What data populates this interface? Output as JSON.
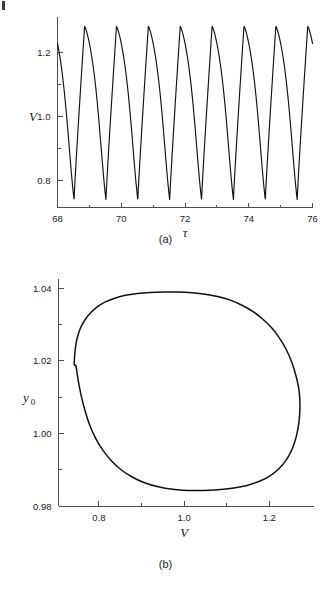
{
  "figure": {
    "background_color": "#ffffff",
    "line_color": "#111111",
    "axis_color": "#4d4d4d",
    "page_mark": "page-edge-mark"
  },
  "panels": [
    {
      "caption": "(a)",
      "name": "time-series-panel"
    },
    {
      "caption": "(b)",
      "name": "phase-portrait-panel"
    }
  ],
  "chart_data": [
    {
      "type": "line",
      "name": "voltage-time-series",
      "title": "",
      "subtitle": "",
      "xlabel": "τ",
      "ylabel": "V",
      "xlim": [
        68,
        76
      ],
      "ylim": [
        0.715,
        1.3
      ],
      "grid": false,
      "legend": null,
      "xticks": [
        68,
        70,
        72,
        74,
        76
      ],
      "xticklabels": [
        "68",
        "70",
        "72",
        "74",
        "76"
      ],
      "xminorticks": [
        69,
        71,
        73,
        75
      ],
      "yticks": [
        0.8,
        1.0,
        1.2
      ],
      "yticklabels": [
        "0.8",
        "1.0",
        "1.2"
      ],
      "yminorticks": [
        0.9,
        1.1
      ],
      "caption": "(a)",
      "description": "Relaxation-type periodic oscillation of V versus dimensionless time tau. Eight full cycles between tau = 68 and tau = 76, period approximately 1.0. Sharp narrow maxima near V = 1.28, rounded broad minima near V = 0.74. Each cycle rises quickly to the peak then falls more slowly. The trace starts at tau = 68 with V = 1.20 on a descending segment and is truncated at tau = 76 mid-descent near V = 1.21.",
      "period": 1.0,
      "peak_value": 1.283,
      "trough_value": 0.74,
      "mean_value": 1.0,
      "n_cycles": 8,
      "peak_times": [
        68.85,
        69.86,
        70.86,
        71.86,
        72.87,
        73.87,
        74.87,
        75.88
      ],
      "trough_times": [
        68.52,
        69.52,
        70.52,
        71.52,
        72.53,
        73.53,
        74.53,
        75.53
      ],
      "start_point": {
        "x": 68.0,
        "y": 1.205
      },
      "end_point": {
        "x": 76.0,
        "y": 1.212
      }
    },
    {
      "type": "line",
      "name": "limit-cycle-phase-portrait",
      "title": "",
      "subtitle": "",
      "xlabel": "V",
      "ylabel": "y0",
      "ylabel_display": "y₀",
      "xlim": [
        0.705,
        1.305
      ],
      "ylim": [
        0.98,
        1.0415
      ],
      "grid": false,
      "legend": null,
      "xticks": [
        0.8,
        1.0,
        1.2
      ],
      "xticklabels": [
        "0.8",
        "1.0",
        "1.2"
      ],
      "xminorticks": [
        0.9,
        1.1
      ],
      "yticks": [
        0.98,
        1.0,
        1.02,
        1.04
      ],
      "yticklabels": [
        "0.98",
        "1.00",
        "1.02",
        "1.04"
      ],
      "yminorticks": [
        0.99,
        1.01,
        1.03
      ],
      "caption": "(b)",
      "closed_curve": true,
      "description": "Closed limit cycle (egg / teardrop shaped orbit) of y0 versus V. Broad rounded top near y0 = 1.039, narrower rounded bottom near y0 = 0.990, leftmost extent V = 0.742 at y0 = 1.019, rightmost extent V = 1.272 at y0 = 1.020.",
      "extrema": {
        "v_min": 0.742,
        "v_max": 1.272,
        "y0_min": 0.99,
        "y0_max": 1.039,
        "v_at_y0_max": 1.0,
        "v_at_y0_min": 1.005,
        "y0_at_v_min": 1.019,
        "y0_at_v_max": 1.02
      },
      "points": [
        [
          0.742,
          1.019
        ],
        [
          0.743,
          1.0215
        ],
        [
          0.7455,
          1.0243
        ],
        [
          0.75,
          1.0268
        ],
        [
          0.757,
          1.0292
        ],
        [
          0.767,
          1.0313
        ],
        [
          0.78,
          1.0332
        ],
        [
          0.796,
          1.0349
        ],
        [
          0.815,
          1.0363
        ],
        [
          0.837,
          1.0373
        ],
        [
          0.862,
          1.0381
        ],
        [
          0.89,
          1.0386
        ],
        [
          0.92,
          1.0389
        ],
        [
          0.952,
          1.039
        ],
        [
          0.985,
          1.039
        ],
        [
          1.018,
          1.0388
        ],
        [
          1.05,
          1.0384
        ],
        [
          1.081,
          1.0377
        ],
        [
          1.11,
          1.0367
        ],
        [
          1.137,
          1.0353
        ],
        [
          1.162,
          1.0336
        ],
        [
          1.185,
          1.0315
        ],
        [
          1.206,
          1.0291
        ],
        [
          1.224,
          1.0263
        ],
        [
          1.24,
          1.0231
        ],
        [
          1.253,
          1.0196
        ],
        [
          1.263,
          1.0158
        ],
        [
          1.27,
          1.0118
        ],
        [
          1.272,
          1.0076
        ],
        [
          1.27,
          1.0034
        ],
        [
          1.264,
          0.9994
        ],
        [
          1.254,
          0.9958
        ],
        [
          1.24,
          0.9927
        ],
        [
          1.222,
          0.9902
        ],
        [
          1.2,
          0.9882
        ],
        [
          1.174,
          0.9867
        ],
        [
          1.145,
          0.9856
        ],
        [
          1.113,
          0.9849
        ],
        [
          1.079,
          0.9845
        ],
        [
          1.044,
          0.9843
        ],
        [
          1.008,
          0.9843
        ],
        [
          0.973,
          0.9846
        ],
        [
          0.939,
          0.9853
        ],
        [
          0.907,
          0.9864
        ],
        [
          0.878,
          0.988
        ],
        [
          0.852,
          0.99
        ],
        [
          0.829,
          0.9925
        ],
        [
          0.809,
          0.9954
        ],
        [
          0.792,
          0.9987
        ],
        [
          0.778,
          1.0024
        ],
        [
          0.767,
          1.0064
        ],
        [
          0.758,
          1.0106
        ],
        [
          0.751,
          1.0148
        ],
        [
          0.746,
          1.0186
        ],
        [
          0.742,
          1.019
        ]
      ]
    }
  ]
}
